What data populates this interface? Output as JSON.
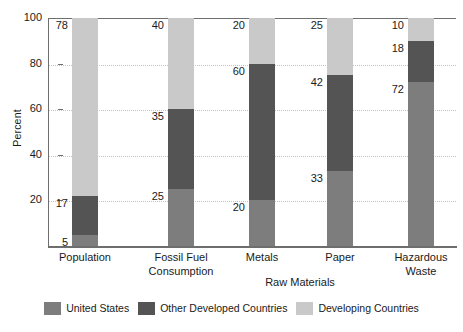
{
  "chart_data": {
    "type": "bar",
    "subtype": "stacked-bar",
    "title": "",
    "xlabel": "",
    "ylabel": "Percent",
    "ylim": [
      0,
      100
    ],
    "yticks": [
      20,
      40,
      60,
      80,
      100
    ],
    "grid": true,
    "legend_position": "bottom",
    "categories": [
      "Population",
      "Fossil Fuel\nConsumption",
      "Metals",
      "Paper",
      "Hazardous\nWaste"
    ],
    "series": [
      {
        "name": "United States",
        "color": "#7d7d7d",
        "values": [
          5,
          25,
          20,
          33,
          72
        ]
      },
      {
        "name": "Other Developed Countries",
        "color": "#545454",
        "values": [
          17,
          35,
          60,
          42,
          18
        ]
      },
      {
        "name": "Developing Countries",
        "color": "#c9c9c9",
        "values": [
          78,
          40,
          20,
          25,
          10
        ]
      }
    ],
    "annotations": [
      {
        "text": "Raw Materials",
        "spans": [
          "Metals",
          "Paper"
        ]
      }
    ]
  },
  "axis": {
    "y_title": "Percent",
    "y_ticks": [
      {
        "label": "100"
      },
      {
        "label": "80"
      },
      {
        "label": "60"
      },
      {
        "label": "40"
      },
      {
        "label": "20"
      }
    ]
  },
  "bars": [
    {
      "name": "population",
      "label_line1": "Population",
      "label_line2": "",
      "segments": [
        {
          "series": "Developing Countries",
          "value": 78,
          "value_label": "78"
        },
        {
          "series": "Other Developed Countries",
          "value": 17,
          "value_label": "17"
        },
        {
          "series": "United States",
          "value": 5,
          "value_label": "5"
        }
      ]
    },
    {
      "name": "fossil-fuel-consumption",
      "label_line1": "Fossil Fuel",
      "label_line2": "Consumption",
      "segments": [
        {
          "series": "Developing Countries",
          "value": 40,
          "value_label": "40"
        },
        {
          "series": "Other Developed Countries",
          "value": 35,
          "value_label": "35"
        },
        {
          "series": "United States",
          "value": 25,
          "value_label": "25"
        }
      ]
    },
    {
      "name": "metals",
      "label_line1": "Metals",
      "label_line2": "",
      "segments": [
        {
          "series": "Developing Countries",
          "value": 20,
          "value_label": "20"
        },
        {
          "series": "Other Developed Countries",
          "value": 60,
          "value_label": "60"
        },
        {
          "series": "United States",
          "value": 20,
          "value_label": "20"
        }
      ]
    },
    {
      "name": "paper",
      "label_line1": "Paper",
      "label_line2": "",
      "segments": [
        {
          "series": "Developing Countries",
          "value": 25,
          "value_label": "25"
        },
        {
          "series": "Other Developed Countries",
          "value": 42,
          "value_label": "42"
        },
        {
          "series": "United States",
          "value": 33,
          "value_label": "33"
        }
      ]
    },
    {
      "name": "hazardous-waste",
      "label_line1": "Hazardous",
      "label_line2": "Waste",
      "segments": [
        {
          "series": "Developing Countries",
          "value": 10,
          "value_label": "10"
        },
        {
          "series": "Other Developed Countries",
          "value": 18,
          "value_label": "18"
        },
        {
          "series": "United States",
          "value": 72,
          "value_label": "72"
        }
      ]
    }
  ],
  "bracket": {
    "label": "Raw Materials"
  },
  "legend": {
    "items": [
      {
        "label": "United States",
        "color": "#7d7d7d"
      },
      {
        "label": "Other Developed Countries",
        "color": "#545454"
      },
      {
        "label": "Developing Countries",
        "color": "#c9c9c9"
      }
    ]
  }
}
